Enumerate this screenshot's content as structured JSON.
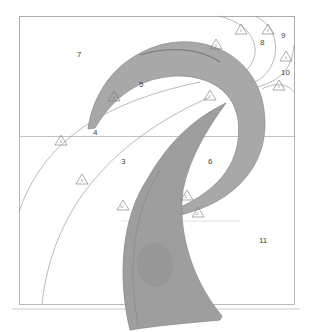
{
  "diagram": {
    "type": "quilt-pattern",
    "region_labels": [
      {
        "id": "7",
        "x": 77,
        "y": 57
      },
      {
        "id": "8",
        "x": 260,
        "y": 45
      },
      {
        "id": "9",
        "x": 283,
        "y": 38
      },
      {
        "id": "10",
        "x": 283,
        "y": 74
      },
      {
        "id": "5",
        "x": 141,
        "y": 87
      },
      {
        "id": "4",
        "x": 95,
        "y": 134
      },
      {
        "id": "3",
        "x": 123,
        "y": 163
      },
      {
        "id": "6",
        "x": 210,
        "y": 163
      },
      {
        "id": "11",
        "x": 262,
        "y": 242
      }
    ],
    "markers": [
      {
        "label": "1",
        "x": 241,
        "y": 30
      },
      {
        "label": "2",
        "x": 268,
        "y": 30
      },
      {
        "label": "3",
        "x": 216,
        "y": 45
      },
      {
        "label": "4",
        "x": 286,
        "y": 57
      },
      {
        "label": "5",
        "x": 279,
        "y": 86
      },
      {
        "label": "6",
        "x": 114,
        "y": 97
      },
      {
        "label": "7",
        "x": 210,
        "y": 96
      },
      {
        "label": "8",
        "x": 61,
        "y": 141
      },
      {
        "label": "9",
        "x": 82,
        "y": 180
      },
      {
        "label": "10",
        "x": 123,
        "y": 206
      },
      {
        "label": "11",
        "x": 187,
        "y": 196
      },
      {
        "label": "12",
        "x": 198,
        "y": 213
      }
    ],
    "colors": {
      "fabric": "#a9a9a9",
      "fabric_dark": "#8a8a8a",
      "line": "#8c8c8c",
      "border": "#aaaaaa"
    }
  }
}
